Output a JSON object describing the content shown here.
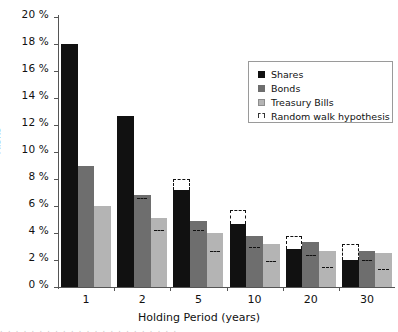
{
  "chart_data": {
    "type": "bar",
    "title": "",
    "xlabel": "Holding Period (years)",
    "ylabel": "Risks",
    "categories": [
      "1",
      "2",
      "5",
      "10",
      "20",
      "30"
    ],
    "ylim": [
      0,
      20
    ],
    "ytick_labels": [
      "0 %",
      "2 %",
      "4 %",
      "6 %",
      "8 %",
      "10 %",
      "12 %",
      "14 %",
      "16 %",
      "18 %",
      "20 %"
    ],
    "ytick_values": [
      0,
      2,
      4,
      6,
      8,
      10,
      12,
      14,
      16,
      18,
      20
    ],
    "grid": false,
    "legend_position": "upper right",
    "series": [
      {
        "name": "Shares",
        "color": "#111111",
        "values": [
          18.0,
          12.7,
          7.2,
          4.7,
          2.8,
          2.0
        ]
      },
      {
        "name": "Bonds",
        "color": "#6e6e6e",
        "values": [
          9.0,
          6.8,
          4.9,
          3.8,
          3.3,
          2.7
        ]
      },
      {
        "name": "Treasury Bills",
        "color": "#b4b4b4",
        "values": [
          6.0,
          5.1,
          4.0,
          3.2,
          2.7,
          2.5
        ]
      }
    ],
    "random_walk_hypothesis": {
      "name": "Random walk hypothesis",
      "style": "dashed-outline",
      "color": "#111111",
      "series": [
        {
          "name": "Shares",
          "values": [
            18.0,
            12.7,
            8.0,
            5.7,
            3.8,
            3.2
          ]
        },
        {
          "name": "Bonds",
          "values": [
            9.0,
            6.6,
            4.2,
            3.0,
            2.4,
            2.0
          ]
        },
        {
          "name": "Treasury Bills",
          "values": [
            6.0,
            4.2,
            2.7,
            1.9,
            1.5,
            1.3
          ]
        }
      ]
    }
  },
  "axes": {
    "ylabel": "Risks",
    "xlabel": "Holding Period (years)",
    "ytick_0": "0 %",
    "ytick_2": "2 %",
    "ytick_4": "4 %",
    "ytick_6": "6 %",
    "ytick_8": "8 %",
    "ytick_10": "10 %",
    "ytick_12": "12 %",
    "ytick_14": "14 %",
    "ytick_16": "16 %",
    "ytick_18": "18 %",
    "ytick_20": "20 %",
    "xtick_1": "1",
    "xtick_2": "2",
    "xtick_5": "5",
    "xtick_10": "10",
    "xtick_20": "20",
    "xtick_30": "30"
  },
  "legend": {
    "items": [
      {
        "label": "Shares",
        "swatch": "shares"
      },
      {
        "label": "Bonds",
        "swatch": "bonds"
      },
      {
        "label": "Treasury Bills",
        "swatch": "tbills"
      },
      {
        "label": "Random walk hypothesis",
        "swatch": "rw"
      }
    ]
  }
}
